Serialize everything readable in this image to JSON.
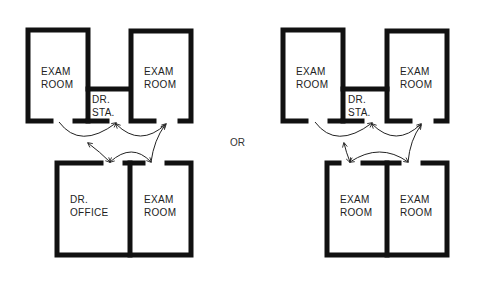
{
  "diagram": {
    "separator_label": "OR",
    "layouts": [
      {
        "name": "option-a",
        "rooms": [
          {
            "id": "exam-top-left",
            "line1": "EXAM",
            "line2": "ROOM"
          },
          {
            "id": "dr-station",
            "line1": "DR.",
            "line2": "STA."
          },
          {
            "id": "exam-top-right",
            "line1": "EXAM",
            "line2": "ROOM"
          },
          {
            "id": "dr-office",
            "line1": "DR.",
            "line2": "OFFICE"
          },
          {
            "id": "exam-bottom-right",
            "line1": "EXAM",
            "line2": "ROOM"
          }
        ]
      },
      {
        "name": "option-b",
        "rooms": [
          {
            "id": "exam-top-left",
            "line1": "EXAM",
            "line2": "ROOM"
          },
          {
            "id": "dr-station",
            "line1": "DR.",
            "line2": "STA."
          },
          {
            "id": "exam-top-right",
            "line1": "EXAM",
            "line2": "ROOM"
          },
          {
            "id": "exam-bottom-left",
            "line1": "EXAM",
            "line2": "ROOM"
          },
          {
            "id": "exam-bottom-right",
            "line1": "EXAM",
            "line2": "ROOM"
          }
        ]
      }
    ],
    "colors": {
      "wall": "#111111",
      "arrow": "#222222",
      "background": "#ffffff"
    }
  }
}
